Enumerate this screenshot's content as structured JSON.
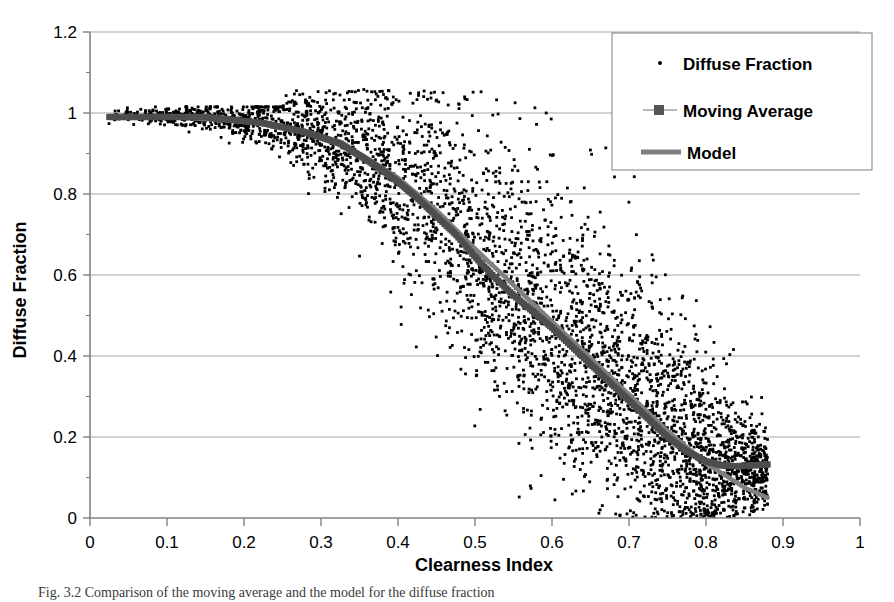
{
  "figure": {
    "caption": "Fig. 3.2 Comparison of the moving average and the model for the diffuse fraction",
    "background_color": "#ffffff"
  },
  "axes": {
    "x_title": "Clearness Index",
    "y_title": "Diffuse Fraction",
    "x_ticks": [
      "0",
      "0.1",
      "0.2",
      "0.3",
      "0.4",
      "0.5",
      "0.6",
      "0.7",
      "0.8",
      "0.9",
      "1"
    ],
    "y_ticks": [
      "0",
      "0.2",
      "0.4",
      "0.6",
      "0.8",
      "1",
      "1.2"
    ],
    "axis_color": "#808080",
    "grid_color": "#a6a6a6"
  },
  "legend": {
    "items": [
      {
        "label": "Diffuse Fraction",
        "marker": "dot-marker",
        "color": "#000000"
      },
      {
        "label": "Moving Average",
        "marker": "square-line-marker",
        "color": "#4d4d4d"
      },
      {
        "label": "Model",
        "marker": "line-marker",
        "color": "#808080"
      }
    ],
    "border_color": "#7f7f7f"
  },
  "chart_data": {
    "type": "scatter",
    "title": "",
    "xlabel": "Clearness Index",
    "ylabel": "Diffuse Fraction",
    "xlim": [
      0,
      1
    ],
    "ylim": [
      0,
      1.2
    ],
    "xticks": [
      0,
      0.1,
      0.2,
      0.3,
      0.4,
      0.5,
      0.6,
      0.7,
      0.8,
      0.9,
      1.0
    ],
    "yticks": [
      0,
      0.2,
      0.4,
      0.6,
      0.8,
      1.0,
      1.2
    ],
    "grid": "horizontal",
    "legend_position": "upper-right",
    "series": [
      {
        "name": "Diffuse Fraction",
        "type": "scatter",
        "marker": "dot",
        "color": "#000000",
        "point_count": 4200,
        "description": "Dense cloud of hourly observations; near 1.0 and tight for kt<0.22, broadening strongly for kt 0.3-0.8 with spread of roughly +-0.3 about the mean trend, converging again near kt=0.8.",
        "mean_trend_x": [
          0.025,
          0.05,
          0.1,
          0.15,
          0.2,
          0.25,
          0.3,
          0.35,
          0.4,
          0.45,
          0.5,
          0.55,
          0.6,
          0.65,
          0.7,
          0.75,
          0.8,
          0.85
        ],
        "mean_trend_y": [
          0.99,
          0.99,
          0.99,
          0.99,
          0.98,
          0.97,
          0.94,
          0.89,
          0.83,
          0.74,
          0.64,
          0.55,
          0.47,
          0.38,
          0.29,
          0.2,
          0.14,
          0.12
        ],
        "spread_x": [
          0.025,
          0.1,
          0.2,
          0.3,
          0.4,
          0.5,
          0.6,
          0.7,
          0.8,
          0.88
        ],
        "spread_halfwidth": [
          0.012,
          0.015,
          0.03,
          0.09,
          0.18,
          0.24,
          0.26,
          0.24,
          0.16,
          0.07
        ]
      },
      {
        "name": "Moving Average",
        "type": "line",
        "marker": "square",
        "color": "#4d4d4d",
        "x": [
          0.025,
          0.05,
          0.075,
          0.1,
          0.125,
          0.15,
          0.175,
          0.2,
          0.225,
          0.25,
          0.275,
          0.3,
          0.325,
          0.35,
          0.375,
          0.4,
          0.425,
          0.45,
          0.475,
          0.5,
          0.525,
          0.55,
          0.575,
          0.6,
          0.625,
          0.65,
          0.675,
          0.7,
          0.725,
          0.75,
          0.775,
          0.8,
          0.82,
          0.84,
          0.86,
          0.88
        ],
        "y": [
          0.99,
          0.99,
          0.99,
          0.99,
          0.99,
          0.99,
          0.985,
          0.98,
          0.975,
          0.965,
          0.955,
          0.94,
          0.925,
          0.895,
          0.865,
          0.83,
          0.79,
          0.745,
          0.7,
          0.645,
          0.595,
          0.55,
          0.51,
          0.47,
          0.425,
          0.38,
          0.335,
          0.29,
          0.245,
          0.2,
          0.165,
          0.14,
          0.13,
          0.128,
          0.13,
          0.132
        ]
      },
      {
        "name": "Model",
        "type": "line",
        "color": "#808080",
        "x": [
          0.025,
          0.05,
          0.1,
          0.15,
          0.2,
          0.25,
          0.3,
          0.35,
          0.4,
          0.45,
          0.5,
          0.55,
          0.6,
          0.65,
          0.7,
          0.75,
          0.8,
          0.85,
          0.88
        ],
        "y": [
          0.99,
          0.99,
          0.99,
          0.985,
          0.98,
          0.965,
          0.94,
          0.9,
          0.84,
          0.76,
          0.665,
          0.575,
          0.485,
          0.395,
          0.305,
          0.215,
          0.135,
          0.075,
          0.05
        ]
      }
    ]
  }
}
